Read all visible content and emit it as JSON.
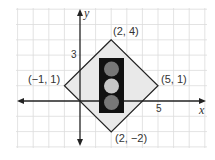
{
  "figure": {
    "axes": {
      "x_label": "x",
      "y_label": "y",
      "x_tick_label": "5",
      "y_tick_label": "3"
    },
    "vertices": [
      {
        "label": "(2, 4)",
        "x": 2,
        "y": 4
      },
      {
        "label": "(−1, 1)",
        "x": -1,
        "y": 1
      },
      {
        "label": "(5, 1)",
        "x": 5,
        "y": 1
      },
      {
        "label": "(2, −2)",
        "x": 2,
        "y": -2
      }
    ],
    "traffic_light": {
      "lights": [
        "top",
        "middle",
        "bottom"
      ]
    }
  },
  "colors": {
    "grid": "#dcdcdc",
    "axis": "#222222",
    "diamond_fill": "#e9e9e9",
    "diamond_stroke": "#222222",
    "light_housing": "#111111",
    "light_dark": "#777777",
    "light_bright": "#c8c8c8"
  }
}
